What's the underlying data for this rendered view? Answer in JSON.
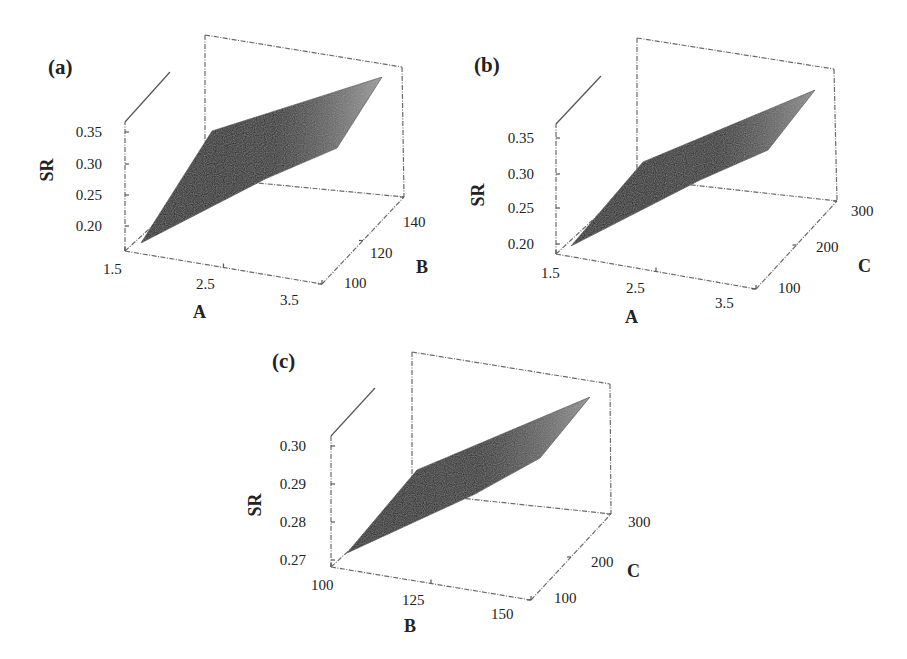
{
  "figure": {
    "background": "#ffffff",
    "surface_dark": "#141414",
    "surface_light": "#a8a8a8"
  },
  "chart_data": [
    {
      "type": "surface3d",
      "panel": "(a)",
      "title": "",
      "zlabel": "SR",
      "xlabel": "A",
      "ylabel": "B",
      "z_ticks": [
        "0.20",
        "0.25",
        "0.30",
        "0.35"
      ],
      "x_ticks": [
        "1.5",
        "2.5",
        "3.5"
      ],
      "y_ticks": [
        "100",
        "120",
        "140"
      ],
      "x_range": [
        1.5,
        3.5
      ],
      "y_range": [
        100,
        140
      ],
      "z_range": [
        0.18,
        0.37
      ],
      "surface_corners": [
        {
          "A": 1.5,
          "B": 100,
          "SR": 0.19
        },
        {
          "A": 1.5,
          "B": 140,
          "SR": 0.26
        },
        {
          "A": 3.5,
          "B": 140,
          "SR": 0.36
        },
        {
          "A": 3.5,
          "B": 100,
          "SR": 0.3
        }
      ]
    },
    {
      "type": "surface3d",
      "panel": "(b)",
      "title": "",
      "zlabel": "SR",
      "xlabel": "A",
      "ylabel": "C",
      "z_ticks": [
        "0.20",
        "0.25",
        "0.30",
        "0.35"
      ],
      "x_ticks": [
        "1.5",
        "2.5",
        "3.5"
      ],
      "y_ticks": [
        "100",
        "200",
        "300"
      ],
      "x_range": [
        1.5,
        3.5
      ],
      "y_range": [
        100,
        300
      ],
      "z_range": [
        0.19,
        0.37
      ],
      "surface_corners": [
        {
          "A": 1.5,
          "C": 100,
          "SR": 0.2
        },
        {
          "A": 1.5,
          "C": 300,
          "SR": 0.24
        },
        {
          "A": 3.5,
          "C": 300,
          "SR": 0.35
        },
        {
          "A": 3.5,
          "C": 100,
          "SR": 0.31
        }
      ]
    },
    {
      "type": "surface3d",
      "panel": "(c)",
      "title": "",
      "zlabel": "SR",
      "xlabel": "B",
      "ylabel": "C",
      "z_ticks": [
        "0.27",
        "0.28",
        "0.29",
        "0.30"
      ],
      "x_ticks": [
        "100",
        "125",
        "150"
      ],
      "y_ticks": [
        "100",
        "200",
        "300"
      ],
      "x_range": [
        100,
        150
      ],
      "y_range": [
        100,
        300
      ],
      "z_range": [
        0.265,
        0.305
      ],
      "surface_corners": [
        {
          "B": 100,
          "C": 100,
          "SR": 0.27
        },
        {
          "B": 100,
          "C": 300,
          "SR": 0.28
        },
        {
          "B": 150,
          "C": 300,
          "SR": 0.302
        },
        {
          "B": 150,
          "C": 100,
          "SR": 0.292
        }
      ]
    }
  ],
  "panels": [
    {
      "label": "(a)",
      "label_pos": [
        48,
        74
      ],
      "zlabel": "SR",
      "zlabel_pos": [
        53,
        170
      ],
      "xlabel": "A",
      "xlabel_pos": [
        193,
        318
      ],
      "ylabel": "B",
      "ylabel_pos": [
        416,
        273
      ],
      "z_ticks": [
        {
          "text": "0.35",
          "x": 102,
          "y": 137
        },
        {
          "text": "0.30",
          "x": 102,
          "y": 169
        },
        {
          "text": "0.25",
          "x": 102,
          "y": 200
        },
        {
          "text": "0.20",
          "x": 102,
          "y": 231
        }
      ],
      "x_ticks": [
        {
          "text": "1.5",
          "x": 103,
          "y": 274
        },
        {
          "text": "2.5",
          "x": 196,
          "y": 289
        },
        {
          "text": "3.5",
          "x": 280,
          "y": 305
        }
      ],
      "y_ticks": [
        {
          "text": "100",
          "x": 344,
          "y": 288
        },
        {
          "text": "120",
          "x": 370,
          "y": 258
        },
        {
          "text": "140",
          "x": 403,
          "y": 227
        }
      ],
      "front_left_bottom": [
        125,
        251
      ],
      "front_left_top": [
        125,
        122
      ],
      "diag_end": [
        170,
        72
      ],
      "back_left_top": [
        205,
        35
      ],
      "back_left_bottom": [
        205,
        178
      ],
      "back_right_top": [
        402,
        67
      ],
      "back_right_bottom": [
        404,
        197
      ],
      "front_right_bottom": [
        322,
        284
      ],
      "surface": [
        [
          141,
          243
        ],
        [
          212,
          131
        ],
        [
          382,
          77
        ],
        [
          337,
          148
        ],
        [
          265,
          179
        ]
      ]
    },
    {
      "label": "(b)",
      "label_pos": [
        474,
        72
      ],
      "zlabel": "SR",
      "zlabel_pos": [
        484,
        195
      ],
      "xlabel": "A",
      "xlabel_pos": [
        625,
        323
      ],
      "ylabel": "C",
      "ylabel_pos": [
        858,
        272
      ],
      "z_ticks": [
        {
          "text": "0.35",
          "x": 534,
          "y": 143
        },
        {
          "text": "0.30",
          "x": 534,
          "y": 179
        },
        {
          "text": "0.25",
          "x": 534,
          "y": 213
        },
        {
          "text": "0.20",
          "x": 534,
          "y": 249
        }
      ],
      "x_ticks": [
        {
          "text": "1.5",
          "x": 541,
          "y": 278
        },
        {
          "text": "2.5",
          "x": 626,
          "y": 293
        },
        {
          "text": "3.5",
          "x": 715,
          "y": 308
        }
      ],
      "y_ticks": [
        {
          "text": "100",
          "x": 778,
          "y": 293
        },
        {
          "text": "200",
          "x": 816,
          "y": 252
        },
        {
          "text": "300",
          "x": 851,
          "y": 216
        }
      ],
      "front_left_bottom": [
        556,
        254
      ],
      "front_left_top": [
        556,
        124
      ],
      "diag_end": [
        601,
        76
      ],
      "back_left_top": [
        637,
        38
      ],
      "back_left_bottom": [
        637,
        179
      ],
      "back_right_top": [
        834,
        69
      ],
      "back_right_bottom": [
        837,
        201
      ],
      "front_right_bottom": [
        756,
        289
      ],
      "surface": [
        [
          571,
          246
        ],
        [
          643,
          162
        ],
        [
          815,
          90
        ],
        [
          768,
          150
        ],
        [
          700,
          180
        ]
      ]
    },
    {
      "label": "(c)",
      "label_pos": [
        272,
        368
      ],
      "zlabel": "SR",
      "zlabel_pos": [
        261,
        505
      ],
      "xlabel": "B",
      "xlabel_pos": [
        404,
        632
      ],
      "ylabel": "C",
      "ylabel_pos": [
        627,
        577
      ],
      "z_ticks": [
        {
          "text": "0.30",
          "x": 306,
          "y": 451
        },
        {
          "text": "0.29",
          "x": 306,
          "y": 489
        },
        {
          "text": "0.28",
          "x": 306,
          "y": 527
        },
        {
          "text": "0.27",
          "x": 306,
          "y": 565
        }
      ],
      "x_ticks": [
        {
          "text": "100",
          "x": 311,
          "y": 590
        },
        {
          "text": "125",
          "x": 402,
          "y": 605
        },
        {
          "text": "150",
          "x": 491,
          "y": 619
        }
      ],
      "y_ticks": [
        {
          "text": "100",
          "x": 554,
          "y": 603
        },
        {
          "text": "200",
          "x": 591,
          "y": 567
        },
        {
          "text": "300",
          "x": 628,
          "y": 527
        }
      ],
      "front_left_bottom": [
        331,
        567
      ],
      "front_left_top": [
        331,
        436
      ],
      "diag_end": [
        375,
        388
      ],
      "back_left_top": [
        412,
        352
      ],
      "back_left_bottom": [
        412,
        493
      ],
      "back_right_top": [
        610,
        384
      ],
      "back_right_bottom": [
        611,
        514
      ],
      "front_right_bottom": [
        531,
        600
      ],
      "surface": [
        [
          347,
          553
        ],
        [
          417,
          470
        ],
        [
          590,
          397
        ],
        [
          540,
          458
        ],
        [
          475,
          494
        ]
      ]
    }
  ]
}
